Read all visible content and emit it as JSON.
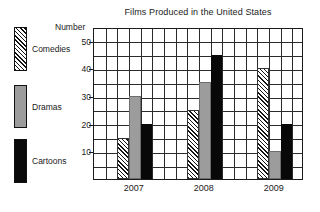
{
  "chart_data": {
    "type": "bar",
    "title": "Films Produced in the United States",
    "xlabel": "",
    "ylabel": "Number",
    "categories": [
      "2007",
      "2008",
      "2009"
    ],
    "series": [
      {
        "name": "Comedies",
        "values": [
          15,
          25,
          40
        ],
        "fill": "diagonal-hatch"
      },
      {
        "name": "Dramas",
        "values": [
          30,
          35,
          10
        ],
        "fill": "#9c9c9c"
      },
      {
        "name": "Cartoons",
        "values": [
          20,
          45,
          20
        ],
        "fill": "#080808"
      }
    ],
    "ylim": [
      0,
      55
    ],
    "ytick_labels": [
      "50",
      "40",
      "30",
      "20",
      "10"
    ],
    "ytick_values": [
      50,
      40,
      30,
      20,
      10
    ],
    "grid_step": 5,
    "grid": true,
    "vertical_grid_columns": 18,
    "legend_position": "left-outside"
  },
  "legend": {
    "items": [
      {
        "label": "Comedies",
        "swatch": "hatch-swatch"
      },
      {
        "label": "Dramas",
        "swatch": "gray-swatch"
      },
      {
        "label": "Cartoons",
        "swatch": "black-swatch"
      }
    ]
  }
}
